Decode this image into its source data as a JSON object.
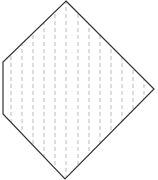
{
  "diagram": {
    "shape": "pentagon",
    "outline_color": "#333333",
    "hatch_color": "#aaaaaa",
    "vertices": [
      [
        66,
        1
      ],
      [
        154,
        89
      ],
      [
        65,
        179
      ],
      [
        3,
        114
      ],
      [
        3,
        62
      ]
    ],
    "hatch_lines_x": [
      11,
      22,
      33,
      44,
      55,
      66,
      78,
      89,
      100,
      111,
      122,
      133,
      144
    ],
    "hatch_style": "dashed-vertical"
  }
}
